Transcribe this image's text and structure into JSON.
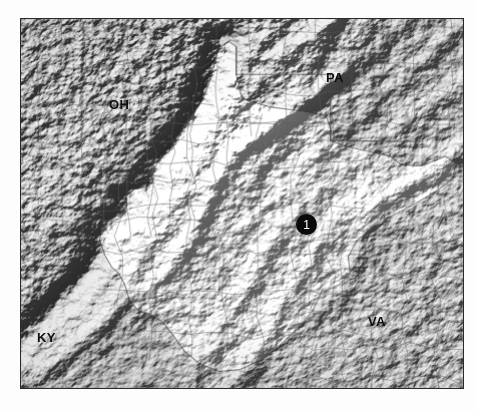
{
  "figure": {
    "kind": "shaded-relief-map",
    "region": "West Virginia and surrounding states",
    "background_color": "#ffffff",
    "frame_color": "#2a2a2a",
    "base_terrain_color": "#b9b9b9"
  },
  "map": {
    "style": "grayscale hillshade with county boundaries",
    "highlighted_state": "West Virginia",
    "boundary_line_color": "#8a8a8a",
    "state_labels": [
      {
        "id": "oh",
        "text": "OH",
        "name": "Ohio",
        "x": 88,
        "y": 79
      },
      {
        "id": "pa",
        "text": "PA",
        "name": "Pennsylvania",
        "x": 305,
        "y": 52
      },
      {
        "id": "va",
        "text": "VA",
        "name": "Virginia",
        "x": 347,
        "y": 296
      },
      {
        "id": "ky",
        "text": "KY",
        "name": "Kentucky",
        "x": 16,
        "y": 312
      }
    ],
    "markers": [
      {
        "id": "site-1",
        "label": "1",
        "shape": "filled-circle",
        "fill_color": "#0a0a0a",
        "text_color": "#ffffff",
        "x": 285,
        "y": 205,
        "radius": 10
      }
    ]
  }
}
